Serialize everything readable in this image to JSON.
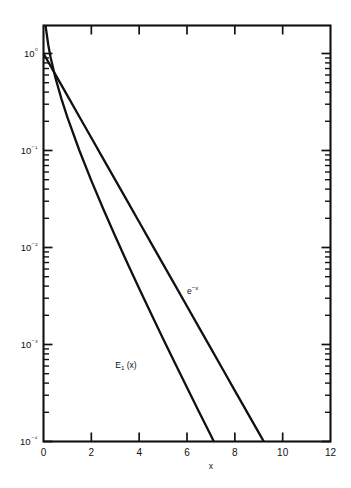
{
  "chart_data": {
    "type": "line",
    "title": "",
    "subtitle": "",
    "xlabel": "x",
    "ylabel": "",
    "xscale": "linear",
    "yscale": "log",
    "xlim": [
      0,
      12
    ],
    "ylim": [
      0.0001,
      1.6
    ],
    "grid": false,
    "legend_position": "inline-annotations",
    "x_ticks": [
      0,
      2,
      4,
      6,
      8,
      10,
      12
    ],
    "x_tick_labels": [
      "0",
      "2",
      "4",
      "6",
      "8",
      "10",
      "12"
    ],
    "y_ticks": [
      1,
      0.1,
      0.01,
      0.001,
      0.0001
    ],
    "y_tick_labels": [
      "10⁰",
      "10⁻¹",
      "10⁻²",
      "10⁻³",
      "10⁻⁴"
    ],
    "y_minor_ticks_per_decade": [
      2,
      3,
      4,
      5,
      6,
      7,
      8,
      9
    ],
    "annotations": [
      {
        "name": "exp-curve-label",
        "base": "e",
        "exponent": "−x",
        "x": 6.0,
        "y": 0.0036
      },
      {
        "name": "e1-curve-label",
        "base": "E",
        "subscript": "1",
        "suffix": "(x)",
        "x": 3.0,
        "y": 0.00062
      }
    ],
    "series": [
      {
        "name": "e^{-x}",
        "label_base": "e",
        "label_exponent": "−x",
        "x": [
          0.0,
          0.25,
          0.5,
          0.75,
          1.0,
          1.5,
          2.0,
          2.5,
          3.0,
          3.5,
          4.0,
          4.5,
          5.0,
          5.5,
          6.0,
          6.5,
          7.0,
          7.5,
          8.0,
          8.5,
          9.0,
          9.21
        ],
        "values": [
          1.0,
          0.7788,
          0.6065,
          0.4724,
          0.3679,
          0.2231,
          0.1353,
          0.08208,
          0.04979,
          0.0302,
          0.01832,
          0.01111,
          0.006738,
          0.004087,
          0.002479,
          0.001503,
          0.000912,
          0.000553,
          0.000335,
          0.000203,
          0.0001234,
          0.0001
        ]
      },
      {
        "name": "E_1(x)",
        "label_base": "E",
        "label_subscript": "1",
        "label_suffix": "(x)",
        "x": [
          0.03,
          0.05,
          0.1,
          0.2,
          0.3,
          0.5,
          0.75,
          1.0,
          1.5,
          2.0,
          2.5,
          3.0,
          3.5,
          4.0,
          4.5,
          5.0,
          5.5,
          6.0,
          6.5,
          7.0,
          7.12
        ],
        "values": [
          2.96,
          2.468,
          1.823,
          1.223,
          0.9057,
          0.5598,
          0.3403,
          0.2194,
          0.1,
          0.0489,
          0.02491,
          0.01305,
          0.00697,
          0.003779,
          0.002073,
          0.001148,
          0.000641,
          0.00036,
          0.000203,
          0.000115,
          0.0001
        ]
      }
    ]
  }
}
